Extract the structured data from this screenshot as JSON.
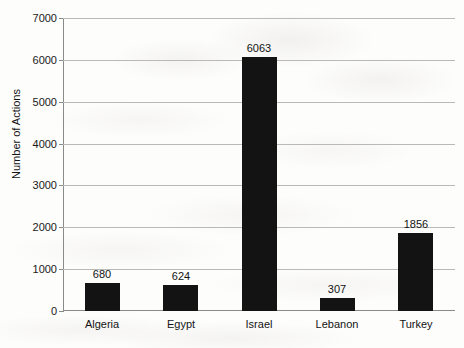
{
  "chart_data": {
    "type": "bar",
    "title": "",
    "subtitle": "",
    "xlabel": "",
    "ylabel": "Number of Actions",
    "categories": [
      "Algeria",
      "Egypt",
      "Israel",
      "Lebanon",
      "Turkey"
    ],
    "values": [
      680,
      624,
      6063,
      307,
      1856
    ],
    "value_labels": [
      "680",
      "624",
      "6063",
      "307",
      "1856"
    ],
    "ylim": [
      0,
      7000
    ],
    "ytick_labels": [
      "7000",
      "6000",
      "5000",
      "4000",
      "3000",
      "2000",
      "1000",
      "0"
    ],
    "ytick_values": [
      7000,
      6000,
      5000,
      4000,
      3000,
      2000,
      1000,
      0
    ],
    "grid": true,
    "grid_orientation": "horizontal",
    "legend": false,
    "legend_position": "none",
    "bar_color": "#131313",
    "gridline_color": "#b9b9b9",
    "axis_color": "#8a8a8a",
    "background_color": "#fdfdfc",
    "text_color": "#141414"
  }
}
